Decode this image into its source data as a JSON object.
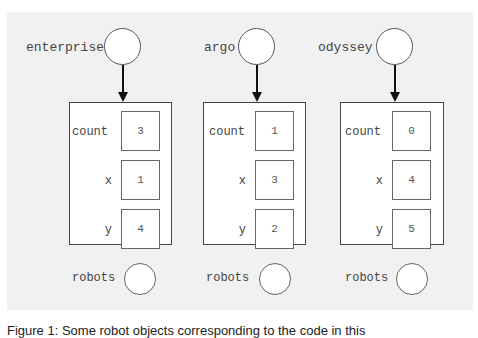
{
  "objects": [
    {
      "var": "enterprise",
      "count": "3",
      "x": "1",
      "y": "4",
      "robots_label": "robots"
    },
    {
      "var": "argo",
      "count": "1",
      "x": "3",
      "y": "2",
      "robots_label": "robots"
    },
    {
      "var": "odyssey",
      "count": "0",
      "x": "4",
      "y": "5",
      "robots_label": "robots"
    }
  ],
  "field_labels": {
    "count": "count",
    "x": "x",
    "y": "y",
    "robots": "robots"
  },
  "caption": "Figure 1: Some robot objects corresponding to the code in this"
}
